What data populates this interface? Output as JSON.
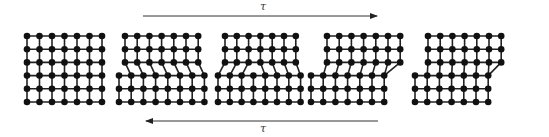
{
  "figure": {
    "colors": {
      "node": "#111111",
      "bond": "#222222",
      "arrow": "#333333",
      "background": "#ffffff"
    },
    "node_radius": 3.3,
    "bond_width": 1.6
  },
  "arrows": [
    {
      "id": "top",
      "label": "τ",
      "x1": 143,
      "x2": 377,
      "y": 16,
      "direction": "right",
      "label_x": 262,
      "label_y": 2
    },
    {
      "id": "bottom",
      "label": "τ",
      "x1": 146,
      "x2": 378,
      "y": 121,
      "direction": "left",
      "label_x": 262,
      "label_y": 124
    }
  ],
  "lattices": [
    {
      "id": "stage-1",
      "caption": "perfect crystal",
      "top_rows": {
        "x0": 27,
        "count": 7
      },
      "bottom_rows": {
        "x0": 27,
        "count": 7
      },
      "spacing": 12.5,
      "y0": 36,
      "dislocation_col": null
    },
    {
      "id": "stage-2",
      "caption": "dislocation enters at left",
      "top_rows": {
        "x0": 125,
        "count": 7
      },
      "bottom_rows": {
        "x0": 119,
        "count": 8
      },
      "spacing": 12.2,
      "y0": 36,
      "dislocation_col": 0
    },
    {
      "id": "stage-3",
      "caption": "dislocation at center",
      "top_rows": {
        "x0": 225,
        "count": 7
      },
      "bottom_rows": {
        "x0": 218,
        "count": 8
      },
      "spacing": 11.8,
      "y0": 36,
      "dislocation_col": 3
    },
    {
      "id": "stage-4",
      "caption": "dislocation near right",
      "top_rows": {
        "x0": 327,
        "count": 7
      },
      "bottom_rows": {
        "x0": 311,
        "count": 7
      },
      "spacing": 12.2,
      "y0": 36,
      "dislocation_col": 6
    },
    {
      "id": "stage-5",
      "caption": "slip step formed",
      "top_rows": {
        "x0": 428,
        "count": 7
      },
      "bottom_rows": {
        "x0": 415,
        "count": 7
      },
      "spacing": 12.2,
      "y0": 36,
      "dislocation_col": null
    }
  ]
}
